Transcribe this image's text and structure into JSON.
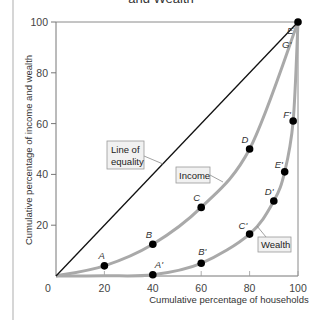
{
  "title_fragment": "and Wealth",
  "colors": {
    "equality_line": "#111111",
    "curve": "#a9a9a9",
    "axis": "#777777",
    "point": "#000000",
    "label_box_fill": "#f1f1f1",
    "label_box_stroke": "#9a9a9a"
  },
  "chart_data": {
    "type": "line",
    "title": "and Wealth",
    "xlabel": "Cumulative percentage of households",
    "ylabel": "Cumulative percentage of income and wealth",
    "xlim": [
      0,
      100
    ],
    "ylim": [
      0,
      100
    ],
    "x_ticks": [
      "0",
      "20",
      "40",
      "60",
      "80",
      "100"
    ],
    "y_ticks": [
      "20",
      "40",
      "60",
      "80",
      "100"
    ],
    "grid": false,
    "legend": "none (callout labels)",
    "series": [
      {
        "name": "Line of equality",
        "points": [
          [
            0,
            0
          ],
          [
            100,
            100
          ]
        ]
      },
      {
        "name": "Income",
        "points": [
          {
            "label": "A",
            "x": 20,
            "y": 4
          },
          {
            "label": "B",
            "x": 40,
            "y": 12.5
          },
          {
            "label": "C",
            "x": 60,
            "y": 27
          },
          {
            "label": "D",
            "x": 80,
            "y": 50
          },
          {
            "label": "E",
            "x": 100,
            "y": 100
          }
        ]
      },
      {
        "name": "Wealth",
        "points": [
          {
            "label": "A'",
            "x": 40,
            "y": 0.5
          },
          {
            "label": "B'",
            "x": 60,
            "y": 5
          },
          {
            "label": "C'",
            "x": 80,
            "y": 16.5
          },
          {
            "label": "D'",
            "x": 90,
            "y": 29.5
          },
          {
            "label": "E'",
            "x": 94.5,
            "y": 41
          },
          {
            "label": "F'",
            "x": 98,
            "y": 61
          },
          {
            "label": "G'",
            "x": 100,
            "y": 100
          }
        ]
      }
    ],
    "annotations": [
      "Line of equality",
      "Income",
      "Wealth"
    ]
  },
  "labels": {
    "line_of_equality_1": "Line of",
    "line_of_equality_2": "equality",
    "income": "Income",
    "wealth": "Wealth",
    "E": "E",
    "G_prime": "G'"
  }
}
